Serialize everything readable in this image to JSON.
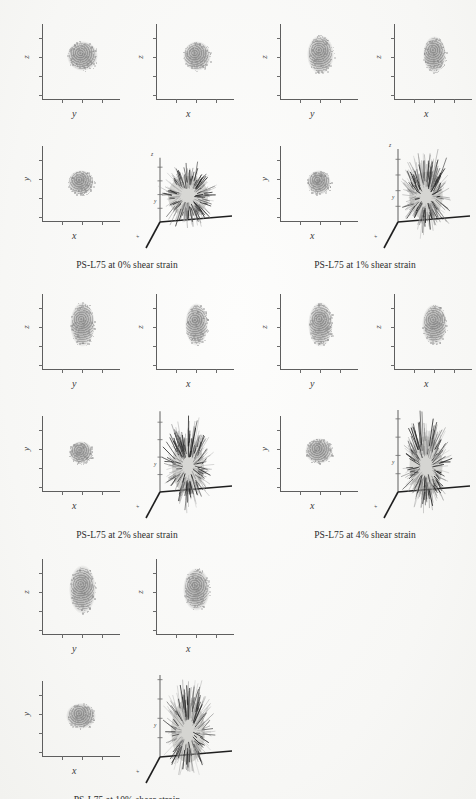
{
  "figure": {
    "material": "PS-L75",
    "axis_labels": {
      "x": "x",
      "y": "y",
      "z": "z"
    }
  },
  "groups": [
    {
      "id": "strain-0",
      "caption": "PS-L75 at 0% shear strain",
      "strain_percent": 0,
      "position": {
        "left": 8,
        "top": 18
      },
      "panels": [
        {
          "name": "projection-zy",
          "xlabel": "y",
          "ylabel": "z",
          "blob": {
            "cx": 0.52,
            "cy": 0.42,
            "rx": 0.2,
            "ry": 0.2
          }
        },
        {
          "name": "projection-zx",
          "xlabel": "x",
          "ylabel": "z",
          "blob": {
            "cx": 0.52,
            "cy": 0.42,
            "rx": 0.18,
            "ry": 0.2
          }
        },
        {
          "name": "projection-yx",
          "xlabel": "x",
          "ylabel": "y",
          "blob": {
            "cx": 0.5,
            "cy": 0.48,
            "rx": 0.17,
            "ry": 0.17
          }
        },
        {
          "name": "vector-plot-3d",
          "aspect": 1.0,
          "spread": 1.0
        }
      ]
    },
    {
      "id": "strain-1",
      "caption": "PS-L75 at 1% shear strain",
      "strain_percent": 1,
      "position": {
        "left": 246,
        "top": 18
      },
      "panels": [
        {
          "name": "projection-zy",
          "xlabel": "y",
          "ylabel": "z",
          "blob": {
            "cx": 0.52,
            "cy": 0.4,
            "rx": 0.17,
            "ry": 0.26
          }
        },
        {
          "name": "projection-zx",
          "xlabel": "x",
          "ylabel": "z",
          "blob": {
            "cx": 0.52,
            "cy": 0.4,
            "rx": 0.15,
            "ry": 0.24
          }
        },
        {
          "name": "projection-yx",
          "xlabel": "x",
          "ylabel": "y",
          "blob": {
            "cx": 0.5,
            "cy": 0.48,
            "rx": 0.16,
            "ry": 0.16
          }
        },
        {
          "name": "vector-plot-3d",
          "aspect": 1.45,
          "spread": 1.0
        }
      ]
    },
    {
      "id": "strain-2",
      "caption": "PS-L75 at 2% shear strain",
      "strain_percent": 2,
      "position": {
        "left": 8,
        "top": 288
      },
      "panels": [
        {
          "name": "projection-zy",
          "xlabel": "y",
          "ylabel": "z",
          "blob": {
            "cx": 0.52,
            "cy": 0.4,
            "rx": 0.16,
            "ry": 0.3
          }
        },
        {
          "name": "projection-zx",
          "xlabel": "x",
          "ylabel": "z",
          "blob": {
            "cx": 0.52,
            "cy": 0.4,
            "rx": 0.15,
            "ry": 0.28
          }
        },
        {
          "name": "projection-yx",
          "xlabel": "x",
          "ylabel": "y",
          "blob": {
            "cx": 0.5,
            "cy": 0.48,
            "rx": 0.16,
            "ry": 0.15
          }
        },
        {
          "name": "vector-plot-3d",
          "aspect": 1.75,
          "spread": 1.05
        }
      ]
    },
    {
      "id": "strain-4",
      "caption": "PS-L75 at 4% shear strain",
      "strain_percent": 4,
      "position": {
        "left": 246,
        "top": 288
      },
      "panels": [
        {
          "name": "projection-zy",
          "xlabel": "y",
          "ylabel": "z",
          "blob": {
            "cx": 0.52,
            "cy": 0.4,
            "rx": 0.16,
            "ry": 0.3
          }
        },
        {
          "name": "projection-zx",
          "xlabel": "x",
          "ylabel": "z",
          "blob": {
            "cx": 0.52,
            "cy": 0.4,
            "rx": 0.16,
            "ry": 0.27
          }
        },
        {
          "name": "projection-yx",
          "xlabel": "x",
          "ylabel": "y",
          "blob": {
            "cx": 0.5,
            "cy": 0.46,
            "rx": 0.18,
            "ry": 0.17
          }
        },
        {
          "name": "vector-plot-3d",
          "aspect": 1.8,
          "spread": 1.1
        }
      ]
    },
    {
      "id": "strain-10",
      "caption": "PS-L75 at 10% shear strain",
      "strain_percent": 10,
      "position": {
        "left": 8,
        "top": 553
      },
      "panels": [
        {
          "name": "projection-zy",
          "xlabel": "y",
          "ylabel": "z",
          "blob": {
            "cx": 0.52,
            "cy": 0.4,
            "rx": 0.17,
            "ry": 0.32
          }
        },
        {
          "name": "projection-zx",
          "xlabel": "x",
          "ylabel": "z",
          "blob": {
            "cx": 0.52,
            "cy": 0.4,
            "rx": 0.17,
            "ry": 0.28
          }
        },
        {
          "name": "projection-yx",
          "xlabel": "x",
          "ylabel": "y",
          "blob": {
            "cx": 0.5,
            "cy": 0.46,
            "rx": 0.19,
            "ry": 0.17
          }
        },
        {
          "name": "vector-plot-3d",
          "aspect": 1.9,
          "spread": 1.15
        }
      ]
    }
  ],
  "colors": {
    "axis": "#5e5e5e",
    "blob": "#8c8c8c",
    "vector_dark": "#2a2a2a",
    "vector_light": "#a9a9a9",
    "page_background": "#fbfbfa",
    "caption_text": "#2b2b2b"
  }
}
